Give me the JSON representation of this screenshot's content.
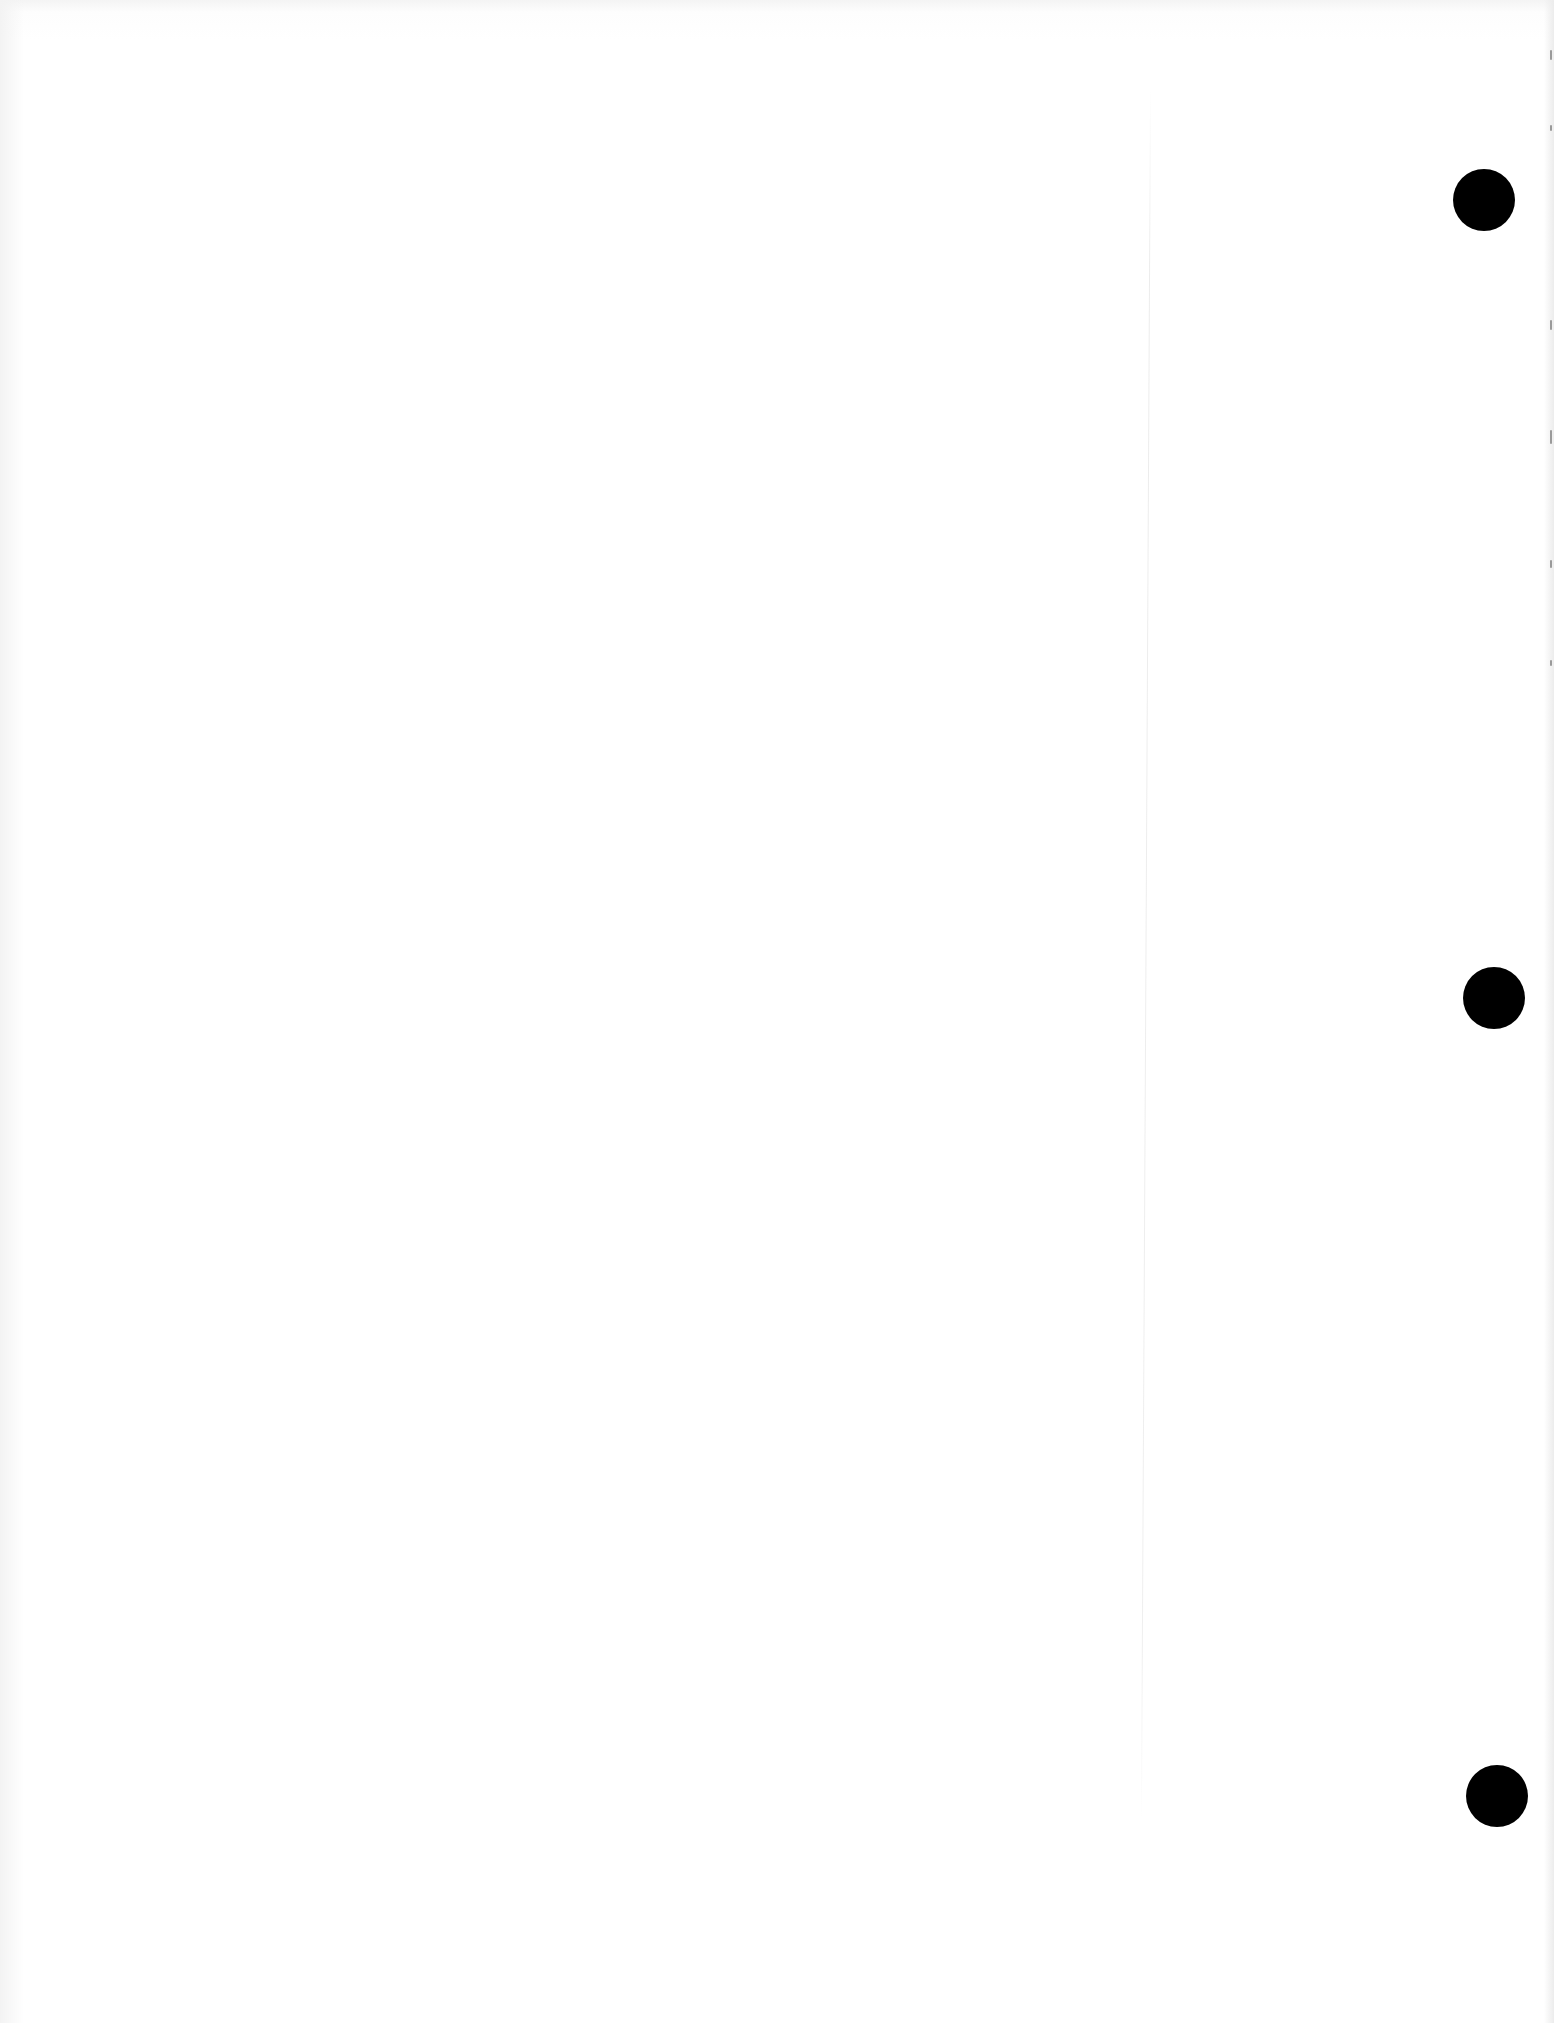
{
  "document": {
    "type": "scanned blank page",
    "text": "",
    "punch_holes": [
      {
        "cx": 1484,
        "cy": 200
      },
      {
        "cx": 1494,
        "cy": 998
      },
      {
        "cx": 1497,
        "cy": 1796
      }
    ],
    "colors": {
      "paper": "#fefefe",
      "hole": "#000000"
    }
  }
}
